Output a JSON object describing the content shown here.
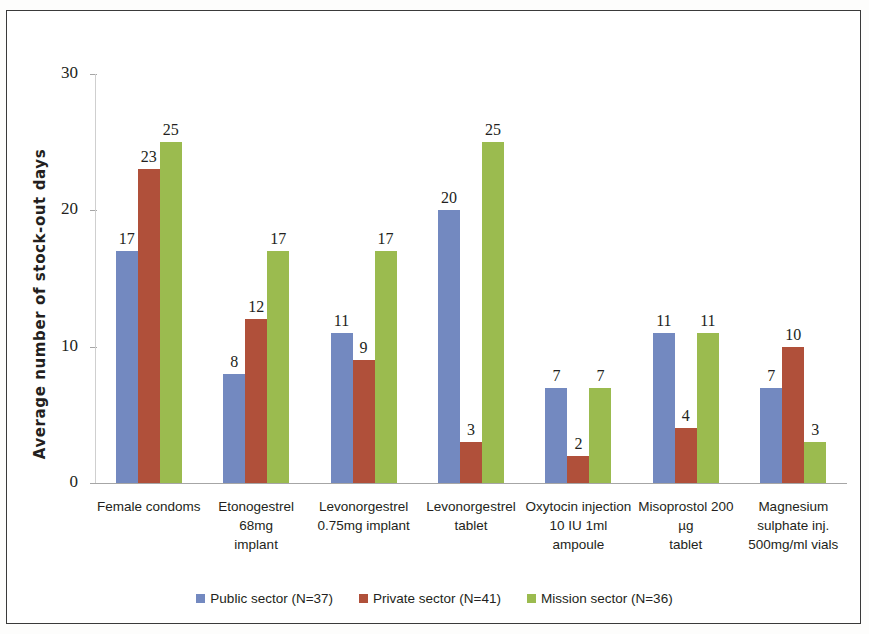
{
  "chart_data": {
    "type": "bar",
    "title": "",
    "xlabel": "",
    "ylabel": "Average number of stock-out days",
    "ylim": [
      0,
      30
    ],
    "yticks": [
      0,
      10,
      20,
      30
    ],
    "grid": false,
    "legend_position": "bottom",
    "categories": [
      "Female condoms",
      "Etonogestrel 68mg implant",
      "Levonorgestrel 0.75mg implant",
      "Levonorgestrel tablet",
      "Oxytocin injection 10 IU 1ml ampoule",
      "Misoprostol 200 µg tablet",
      "Magnesium sulphate inj. 500mg/ml vials"
    ],
    "category_lines": [
      [
        "Female condoms"
      ],
      [
        "Etonogestrel 68mg",
        "implant"
      ],
      [
        "Levonorgestrel",
        "0.75mg implant"
      ],
      [
        "Levonorgestrel",
        "tablet"
      ],
      [
        "Oxytocin injection",
        "10 IU 1ml ampoule"
      ],
      [
        "Misoprostol 200 µg",
        "tablet"
      ],
      [
        "Magnesium",
        "sulphate inj.",
        "500mg/ml vials"
      ]
    ],
    "series": [
      {
        "name": "Public sector (N=37)",
        "color": "#7389c0",
        "values": [
          17,
          8,
          11,
          20,
          7,
          11,
          7
        ]
      },
      {
        "name": "Private sector (N=41)",
        "color": "#b0503a",
        "values": [
          23,
          12,
          9,
          3,
          2,
          4,
          10
        ]
      },
      {
        "name": "Mission sector (N=36)",
        "color": "#9bbb4f",
        "values": [
          25,
          17,
          17,
          25,
          7,
          11,
          3
        ]
      }
    ]
  },
  "legend": {
    "items": [
      {
        "label": "Public sector (N=37)",
        "color": "#7389c0"
      },
      {
        "label": "Private sector (N=41)",
        "color": "#b0503a"
      },
      {
        "label": "Mission sector (N=36)",
        "color": "#9bbb4f"
      }
    ]
  }
}
